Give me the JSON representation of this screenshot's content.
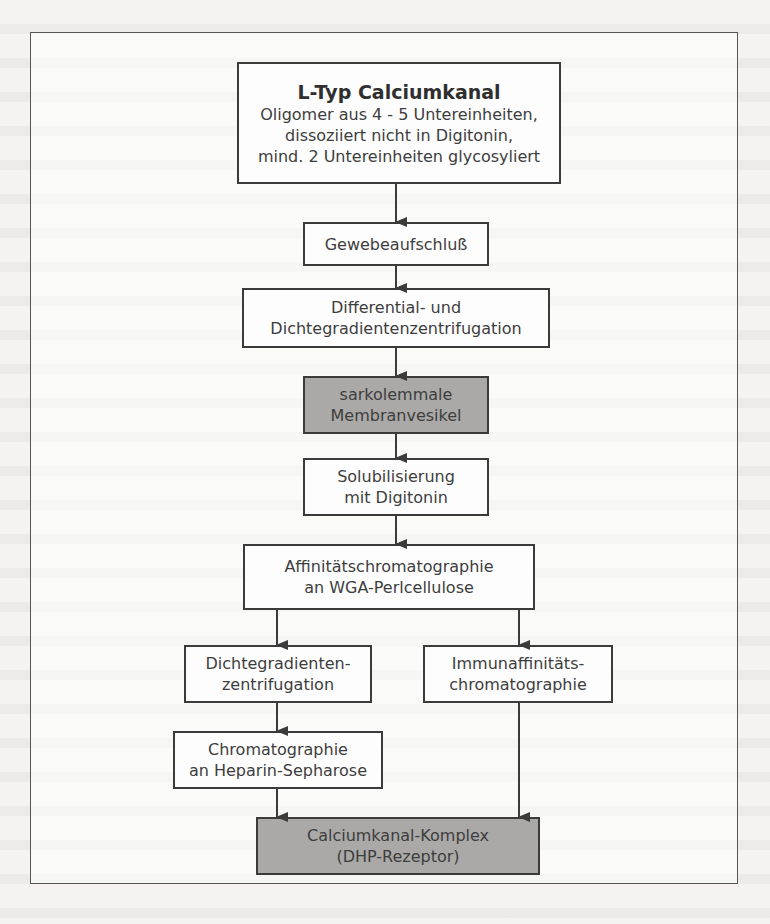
{
  "diagram": {
    "type": "flowchart",
    "nodes": {
      "top": {
        "title": "L-Typ Calciumkanal",
        "lines": [
          "Oligomer aus 4 - 5 Untereinheiten,",
          "dissoziiert nicht in Digitonin,",
          "mind. 2 Untereinheiten glycosyliert"
        ]
      },
      "step1": {
        "lines": [
          "Gewebeaufschluß"
        ]
      },
      "step2": {
        "lines": [
          "Differential- und",
          "Dichtegradientenzentrifugation"
        ]
      },
      "step3": {
        "lines": [
          "sarkolemmale",
          "Membranvesikel"
        ],
        "shaded": true
      },
      "step4": {
        "lines": [
          "Solubilisierung",
          "mit Digitonin"
        ]
      },
      "step5": {
        "lines": [
          "Affinitätschromatographie",
          "an WGA-Perlcellulose"
        ]
      },
      "left1": {
        "lines": [
          "Dichtegradienten-",
          "zentrifugation"
        ]
      },
      "right1": {
        "lines": [
          "Immunaffinitäts-",
          "chromatographie"
        ]
      },
      "left2": {
        "lines": [
          "Chromatographie",
          "an Heparin-Sepharose"
        ]
      },
      "result": {
        "lines": [
          "Calciumkanal-Komplex",
          "(DHP-Rezeptor)"
        ],
        "shaded": true
      }
    },
    "edges": [
      [
        "top",
        "step1"
      ],
      [
        "step1",
        "step2"
      ],
      [
        "step2",
        "step3"
      ],
      [
        "step3",
        "step4"
      ],
      [
        "step4",
        "step5"
      ],
      [
        "step5",
        "left1"
      ],
      [
        "step5",
        "right1"
      ],
      [
        "left1",
        "left2"
      ],
      [
        "left2",
        "result"
      ],
      [
        "right1",
        "result"
      ]
    ],
    "colors": {
      "shaded_fill": "#aaa9a7",
      "box_fill": "#fdfdfd",
      "stroke": "#3b3b3b"
    }
  }
}
